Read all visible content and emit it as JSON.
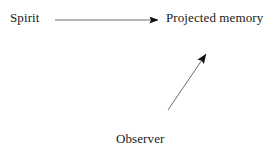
{
  "diagram": {
    "background_color": "#ffffff",
    "text_color": "#1a1a1a",
    "line_color": "#6e6e6e",
    "arrowhead_color": "#111111",
    "nodes": [
      {
        "id": "spirit",
        "label": "Spirit",
        "x": 10,
        "y": 11
      },
      {
        "id": "projected-memory",
        "label": "Projected memory",
        "x": 166,
        "y": 11
      },
      {
        "id": "observer",
        "label": "Observer",
        "x": 116,
        "y": 132
      }
    ],
    "arrows": [
      {
        "id": "spirit-to-projected-memory",
        "from": "spirit",
        "to": "projected-memory",
        "x1": 55,
        "y1": 20,
        "x2": 159,
        "y2": 20,
        "label": ""
      },
      {
        "id": "observer-to-projected-memory",
        "from": "observer",
        "to": "projected-memory",
        "x1": 168,
        "y1": 110,
        "x2": 207,
        "y2": 53,
        "label": ""
      }
    ]
  }
}
